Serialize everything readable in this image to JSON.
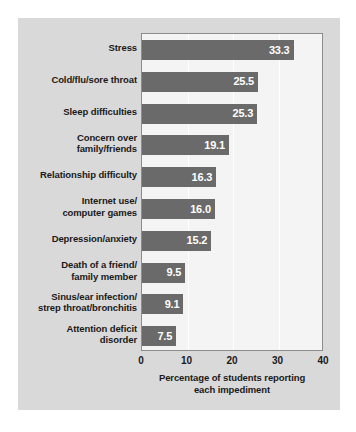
{
  "colors": {
    "card_background": "#d9d9d9",
    "plot_background": "#f4f4f4",
    "bar": "#6a6a6a",
    "bar_value_text": "#ffffff",
    "axis_text": "#1a1a1a",
    "gridline": "#ffffff",
    "plot_border": "#8c8c8c"
  },
  "chart_data": {
    "type": "bar",
    "orientation": "horizontal",
    "title": "",
    "xlabel": "Percentage of students reporting each impediment",
    "ylabel": "",
    "xlim": [
      0,
      40
    ],
    "xticks": [
      0,
      10,
      20,
      30,
      40
    ],
    "xtick_labels": [
      "0",
      "10",
      "20",
      "30",
      "40"
    ],
    "grid": true,
    "legend": false,
    "categories": [
      "Stress",
      "Cold/flu/sore throat",
      "Sleep difficulties",
      "Concern over family/friends",
      "Relationship difficulty",
      "Internet use/computer games",
      "Depression/anxiety",
      "Death of a friend/family member",
      "Sinus/ear infection/strep throat/bronchitis",
      "Attention deficit disorder"
    ],
    "category_lines": [
      [
        "Stress"
      ],
      [
        "Cold/flu/sore throat"
      ],
      [
        "Sleep difficulties"
      ],
      [
        "Concern over",
        "family/friends"
      ],
      [
        "Relationship difficulty"
      ],
      [
        "Internet use/",
        "computer games"
      ],
      [
        "Depression/anxiety"
      ],
      [
        "Death of a friend/",
        "family member"
      ],
      [
        "Sinus/ear infection/",
        "strep throat/bronchitis"
      ],
      [
        "Attention deficit",
        "disorder"
      ]
    ],
    "values": [
      33.3,
      25.5,
      25.3,
      19.1,
      16.3,
      16.0,
      15.2,
      9.5,
      9.1,
      7.5
    ],
    "value_labels": [
      "33.3",
      "25.5",
      "25.3",
      "19.1",
      "16.3",
      "16.0",
      "15.2",
      "9.5",
      "9.1",
      "7.5"
    ]
  },
  "axis_title_lines": [
    "Percentage of students reporting",
    "each impediment"
  ]
}
